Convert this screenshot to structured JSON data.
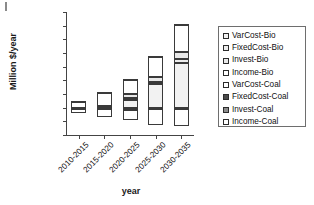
{
  "chart_data": {
    "type": "bar",
    "stacked": true,
    "title": "",
    "xlabel": "year",
    "ylabel": "Million $/year",
    "categories": [
      "2010-2015",
      "2015-2020",
      "2020-2025",
      "2025-2030",
      "2030-2035"
    ],
    "ylim": [
      -20000,
      70000
    ],
    "ytick_labels": [
      "70000",
      "60000",
      "50000",
      "40000",
      "30000",
      "20000",
      "10000",
      "0",
      "-10000",
      "-20000"
    ],
    "ytick_values": [
      70000,
      60000,
      50000,
      40000,
      30000,
      20000,
      10000,
      0,
      -10000,
      -20000
    ],
    "grid": false,
    "legend_position": "right",
    "series": [
      {
        "name": "VarCost-Bio",
        "color": "#f2f2f2",
        "values": [
          0,
          0,
          5500,
          17000,
          33000
        ]
      },
      {
        "name": "FixedCost-Bio",
        "color": "#ededed",
        "values": [
          0,
          0,
          1500,
          1500,
          2500
        ]
      },
      {
        "name": "Invest-Bio",
        "color": "#e8e8e8",
        "values": [
          0,
          1500,
          3000,
          4000,
          5000
        ]
      },
      {
        "name": "Income-Bio",
        "color": "#ffffff",
        "values": [
          0,
          0,
          0,
          0,
          0
        ]
      },
      {
        "name": "VarCost-Coal",
        "color": "#ffffff",
        "values": [
          4200,
          9500,
          10000,
          15000,
          20000
        ]
      },
      {
        "name": "FixedCost-Coal",
        "color": "#4a4a4a",
        "values": [
          1000,
          800,
          700,
          600,
          500
        ]
      },
      {
        "name": "Invest-Coal",
        "color": "#8c8c8c",
        "values": [
          -900,
          -1100,
          -1400,
          -1200,
          -1300
        ]
      },
      {
        "name": "Income-Coal",
        "color": "#ffffff",
        "values": [
          -3200,
          -5800,
          -7600,
          -11500,
          -11800
        ]
      }
    ],
    "bar_totals_positive": [
      5200,
      11800,
      20700,
      38100,
      61000
    ],
    "bar_totals_negative": [
      -4100,
      -6900,
      -9000,
      -12700,
      -13100
    ]
  },
  "legend": {
    "items": [
      "VarCost-Bio",
      "FixedCost-Bio",
      "Invest-Bio",
      "Income-Bio",
      "VarCost-Coal",
      "FixedCost-Coal",
      "Invest-Coal",
      "Income-Coal"
    ]
  }
}
